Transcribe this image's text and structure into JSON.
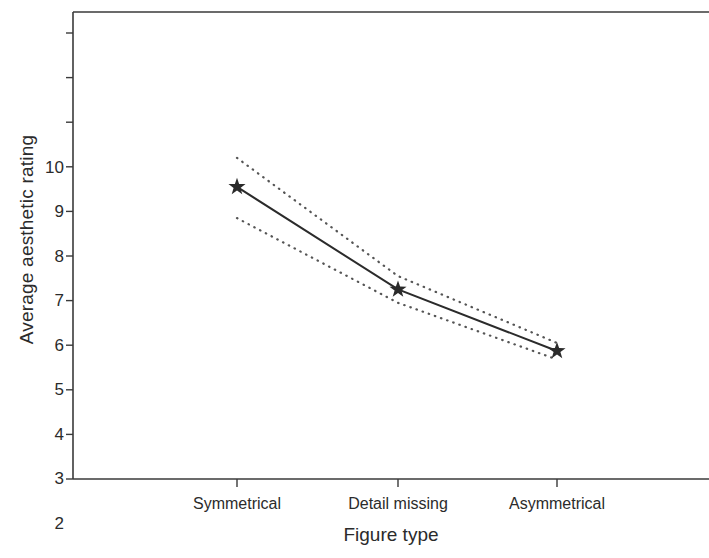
{
  "chart_data": {
    "type": "line",
    "title": "",
    "xlabel": "Figure type",
    "ylabel": "Average aesthetic rating",
    "categories": [
      "Symmetrical",
      "Detail missing",
      "Asymmetrical"
    ],
    "ylim": [
      0,
      10
    ],
    "yticks": [
      0,
      1,
      2,
      3,
      4,
      5,
      6,
      7,
      8,
      9,
      10
    ],
    "ytick_labels": [
      "0",
      "1",
      "2",
      "3",
      "4",
      "5",
      "6",
      "7",
      "8",
      "9",
      "10"
    ],
    "grid": false,
    "legend": null,
    "marker": "star",
    "series": [
      {
        "name": "Mean aesthetic rating",
        "style": "solid",
        "color": "#2b2b2b",
        "values": [
          6.55,
          4.25,
          2.87
        ]
      },
      {
        "name": "Upper 95% confidence limit",
        "style": "dotted",
        "color": "#555555",
        "values": [
          7.2,
          4.55,
          3.05
        ]
      },
      {
        "name": "Lower 95% confidence limit",
        "style": "dotted",
        "color": "#555555",
        "values": [
          5.85,
          3.95,
          2.68
        ]
      }
    ]
  },
  "axes": {
    "y_title": "Average aesthetic rating",
    "x_title": "Figure type",
    "y_tick_0": "0",
    "y_tick_1": "1",
    "y_tick_2": "2",
    "y_tick_3": "3",
    "y_tick_4": "4",
    "y_tick_5": "5",
    "y_tick_6": "6",
    "y_tick_7": "7",
    "y_tick_8": "8",
    "y_tick_9": "9",
    "y_tick_10": "10",
    "x_tick_0": "Symmetrical",
    "x_tick_1": "Detail missing",
    "x_tick_2": "Asymmetrical"
  },
  "colors": {
    "line": "#2b2b2b",
    "ci": "#555555",
    "axis": "#3a3a3a",
    "background": "#ffffff"
  }
}
